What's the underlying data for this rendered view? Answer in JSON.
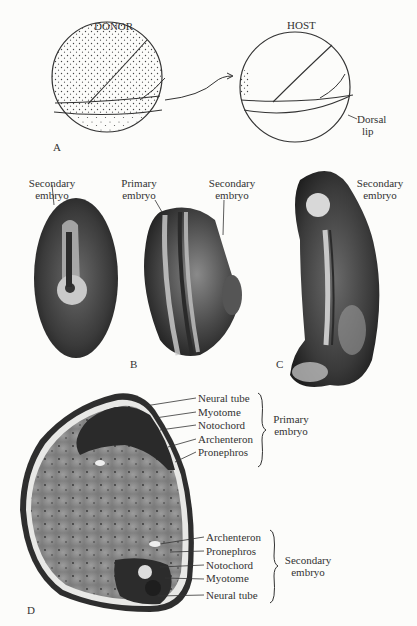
{
  "figure": {
    "panel_a": {
      "letter": "A",
      "donor_label": "DONOR",
      "host_label": "HOST",
      "dorsal_lip_line1": "Dorsal",
      "dorsal_lip_line2": "lip"
    },
    "panel_b": {
      "letter": "B",
      "secondary_left_line1": "Secondary",
      "secondary_left_line2": "embryo",
      "primary_line1": "Primary",
      "primary_line2": "embryo",
      "secondary_right_line1": "Secondary",
      "secondary_right_line2": "embryo"
    },
    "panel_c": {
      "letter": "C",
      "secondary_line1": "Secondary",
      "secondary_line2": "embryo"
    },
    "panel_d": {
      "letter": "D",
      "primary_labels": [
        "Neural tube",
        "Myotome",
        "Notochord",
        "Archenteron",
        "Pronephros"
      ],
      "primary_group_line1": "Primary",
      "primary_group_line2": "embryo",
      "secondary_labels": [
        "Archenteron",
        "Pronephros",
        "Notochord",
        "Myotome",
        "Neural tube"
      ],
      "secondary_group_line1": "Secondary",
      "secondary_group_line2": "embryo"
    }
  }
}
